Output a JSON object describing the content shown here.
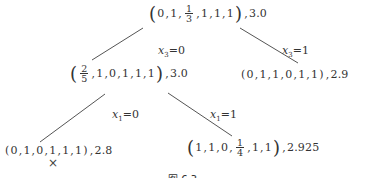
{
  "diagram": {
    "type": "branch-and-bound-tree",
    "nodes": {
      "root": {
        "vector": [
          "0",
          "1",
          {
            "num": "1",
            "den": "3"
          },
          "1",
          "1",
          "1"
        ],
        "value": "3.0"
      },
      "left1": {
        "vector": [
          {
            "num": "2",
            "den": "5"
          },
          "1",
          "0",
          "1",
          "1",
          "1"
        ],
        "value": "3.0"
      },
      "right1": {
        "vector": [
          "0",
          "1",
          "1",
          "0",
          "1",
          "1"
        ],
        "value": "2.9"
      },
      "left2": {
        "vector": [
          "0",
          "1",
          "0",
          "1",
          "1",
          "1"
        ],
        "value": "2.8",
        "pruned_mark": "×"
      },
      "right2": {
        "vector": [
          "1",
          "1",
          "0",
          {
            "num": "1",
            "den": "4"
          },
          "1",
          "1"
        ],
        "value": "2.925"
      }
    },
    "edges": [
      {
        "from": "root",
        "to": "left1",
        "var": "x",
        "sub": "3",
        "eq": "=0"
      },
      {
        "from": "root",
        "to": "right1",
        "var": "x",
        "sub": "3",
        "eq": "=1"
      },
      {
        "from": "left1",
        "to": "left2",
        "var": "x",
        "sub": "1",
        "eq": "=0"
      },
      {
        "from": "left1",
        "to": "right2",
        "var": "x",
        "sub": "1",
        "eq": "=1"
      }
    ],
    "caption": "图 6.3"
  },
  "text": {
    "comma": ",",
    "lparen": "(",
    "rparen": ")"
  }
}
